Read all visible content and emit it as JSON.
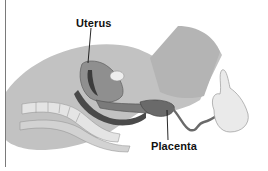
{
  "diagram": {
    "labels": [
      {
        "id": "uterus",
        "text": "Uterus",
        "x": 76,
        "y": 23,
        "leader_to": [
          88,
          63
        ]
      },
      {
        "id": "placenta",
        "text": "Placenta",
        "x": 151,
        "y": 145,
        "leader_to": [
          167,
          110
        ]
      }
    ],
    "colors": {
      "background": "#ffffff",
      "tissue_light": "#c9c9c9",
      "tissue_mid": "#a8a8a8",
      "tissue_dark": "#6e6e6e",
      "cavity": "#4a4a4a",
      "bone": "#e6e6e6",
      "skin": "#ececec",
      "rule": "#7a7a7a",
      "label_text": "#111111"
    }
  }
}
